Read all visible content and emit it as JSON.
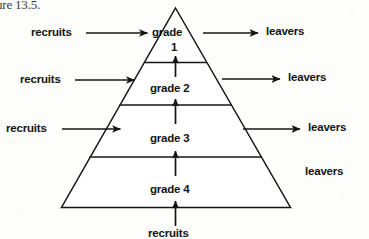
{
  "figure": {
    "caption_fragment": "ure 13.5.",
    "type": "pyramid-flow-diagram",
    "ink_color": "#141414",
    "background_color": "#fdfdfb"
  },
  "pyramid": {
    "apex_label": "apex",
    "levels": [
      {
        "name": "grade-1",
        "label_line1": "grade",
        "label_line2": "1"
      },
      {
        "name": "grade-2",
        "label_line1": "grade 2",
        "label_line2": ""
      },
      {
        "name": "grade-3",
        "label_line1": "grade 3",
        "label_line2": ""
      },
      {
        "name": "grade-4",
        "label_line1": "grade 4",
        "label_line2": ""
      }
    ]
  },
  "inflows": {
    "label": "recruits",
    "items": [
      {
        "label": "recruits",
        "target_level": "grade-1"
      },
      {
        "label": "recruits",
        "target_level": "grade-2"
      },
      {
        "label": "recruits",
        "target_level": "grade-3"
      }
    ],
    "bottom": {
      "label": "recruits",
      "target_level": "grade-4"
    }
  },
  "outflows": {
    "label": "leavers",
    "items": [
      {
        "label": "leavers",
        "source_level": "grade-1",
        "has_arrow": true
      },
      {
        "label": "leavers",
        "source_level": "grade-2",
        "has_arrow": true
      },
      {
        "label": "leavers",
        "source_level": "grade-3",
        "has_arrow": true
      },
      {
        "label": "leavers",
        "source_level": "grade-4",
        "has_arrow": false
      }
    ]
  },
  "promotions": [
    {
      "from": "grade-2",
      "to": "grade-1"
    },
    {
      "from": "grade-3",
      "to": "grade-2"
    },
    {
      "from": "grade-4",
      "to": "grade-3"
    }
  ]
}
